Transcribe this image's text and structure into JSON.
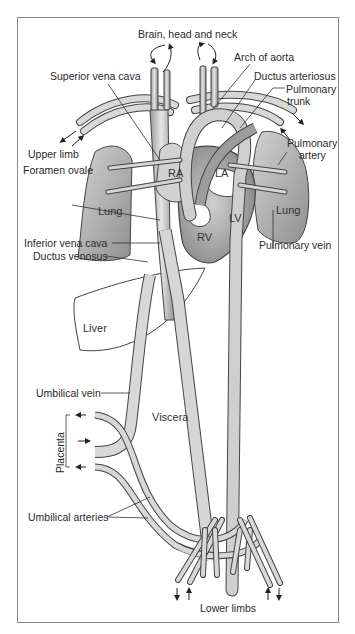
{
  "diagram": {
    "type": "anatomical",
    "labels": {
      "brain_head_neck": "Brain, head and neck",
      "arch_of_aorta": "Arch of aorta",
      "superior_vena_cava": "Superior vena cava",
      "ductus_arteriosus": "Ductus arteriosus",
      "pulmonary_trunk_1": "Pulmonary",
      "pulmonary_trunk_2": "trunk",
      "upper_limb": "Upper limb",
      "pulmonary_artery_1": "Pulmonary",
      "pulmonary_artery_2": "artery",
      "foramen_ovale": "Foramen ovale",
      "ra": "RA",
      "la": "LA",
      "lv": "LV",
      "rv": "RV",
      "lung_left": "Lung",
      "lung_right": "Lung",
      "inferior_vena_cava": "Inferior vena cava",
      "pulmonary_vein": "Pulmonary vein",
      "ductus_venosus": "Ductus venosus",
      "liver": "Liver",
      "umbilical_vein": "Umbilical vein",
      "viscera": "Viscera",
      "placenta": "Placenta",
      "umbilical_arteries": "Umbilical arteries",
      "lower_limbs": "Lower limbs"
    },
    "colors": {
      "vessel_fill": "#c9c9c9",
      "vessel_stroke": "#4a4a4a",
      "organ_fill": "#bdbdbd",
      "frame": "#8a8a8a",
      "text": "#2a2a2a"
    }
  }
}
